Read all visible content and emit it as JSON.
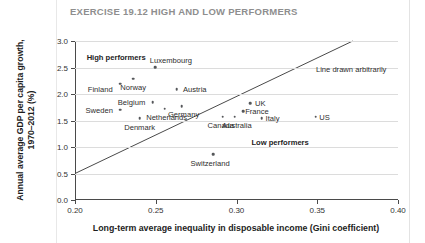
{
  "title": "EXERCISE 19.12 HIGH AND LOW PERFORMERS",
  "chart_data": {
    "type": "scatter",
    "title": "EXERCISE 19.12 HIGH AND LOW PERFORMERS",
    "xlabel": "Long-term average inequality in disposable income (Gini coefficient)",
    "ylabel": "Annual average GDP per capita growth, 1970–2012 (%)",
    "ylabel_line1": "Annual average GDP per capita growth,",
    "ylabel_line2": "1970–2012 (%)",
    "xlim": [
      0.2,
      0.4
    ],
    "ylim": [
      0.0,
      3.0
    ],
    "xticks": [
      0.2,
      0.25,
      0.3,
      0.35,
      0.4
    ],
    "xtick_labels": [
      "0.20",
      "0.25",
      "0.30",
      "0.35",
      "0.40"
    ],
    "yticks": [
      0.0,
      0.5,
      1.0,
      1.5,
      2.0,
      2.5,
      3.0
    ],
    "ytick_labels": [
      "0.0",
      "0.5",
      "1.0",
      "1.5",
      "2.0",
      "2.5",
      "3.0"
    ],
    "grid": "horizontal",
    "legend": "none",
    "marker_color": "#55575a",
    "line_color": "#4a4a4a",
    "points": [
      {
        "name": "Luxembourg",
        "x": 0.2495,
        "y": 2.505,
        "label_dx": 16,
        "label_dy": -7
      },
      {
        "name": "Norway",
        "x": 0.236,
        "y": 2.29,
        "label_dx": 0,
        "label_dy": 8
      },
      {
        "name": "Finland",
        "x": 0.228,
        "y": 2.195,
        "label_dx": -20,
        "label_dy": 5
      },
      {
        "name": "Austria",
        "x": 0.263,
        "y": 2.095,
        "label_dx": 18,
        "label_dy": 0
      },
      {
        "name": "Belgium",
        "x": 0.248,
        "y": 1.85,
        "label_dx": -21,
        "label_dy": 0
      },
      {
        "name": "Germany",
        "x": 0.266,
        "y": 1.775,
        "label_dx": 2,
        "label_dy": 8
      },
      {
        "name": "Sweden",
        "x": 0.228,
        "y": 1.705,
        "label_dx": -21,
        "label_dy": 0
      },
      {
        "name": "Netherlands",
        "x": 0.2555,
        "y": 1.72,
        "label_dx": 2,
        "label_dy": 8
      },
      {
        "name": "Denmark",
        "x": 0.24,
        "y": 1.545,
        "label_dx": 0,
        "label_dy": 9
      },
      {
        "name": "UK",
        "x": 0.3085,
        "y": 1.83,
        "label_dx": 10,
        "label_dy": 0
      },
      {
        "name": "France",
        "x": 0.304,
        "y": 1.68,
        "label_dx": 14,
        "label_dy": 0
      },
      {
        "name": "Canada",
        "x": 0.2915,
        "y": 1.57,
        "label_dx": -2,
        "label_dy": 8
      },
      {
        "name": "Australia",
        "x": 0.299,
        "y": 1.57,
        "label_dx": 2,
        "label_dy": 8
      },
      {
        "name": "Italy",
        "x": 0.3155,
        "y": 1.545,
        "label_dx": 11,
        "label_dy": 0
      },
      {
        "name": "US",
        "x": 0.349,
        "y": 1.575,
        "label_dx": 9,
        "label_dy": 0
      },
      {
        "name": "Switzerland",
        "x": 0.2855,
        "y": 0.86,
        "label_dx": -3,
        "label_dy": 9
      }
    ],
    "annotations": [
      {
        "name": "high-performers",
        "text": "High performers",
        "x": 0.2255,
        "y": 2.7,
        "bold": true
      },
      {
        "name": "low-performers",
        "text": "Low performers",
        "x": 0.327,
        "y": 1.09,
        "bold": true
      },
      {
        "name": "line-note",
        "text": "Line drawn arbitrarily",
        "x": 0.371,
        "y": 2.47,
        "bold": false
      }
    ],
    "line": {
      "label": "Line drawn arbitrarily",
      "x0": 0.2,
      "y0": 0.5,
      "x1": 0.372,
      "y1": 3.0
    }
  }
}
